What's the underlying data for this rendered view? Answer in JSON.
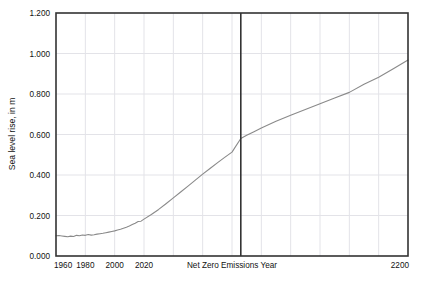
{
  "chart_data": {
    "type": "line",
    "title": "",
    "subtitle": "",
    "xlabel": "",
    "ylabel": "Sea level rise, in m",
    "xlim": [
      1960,
      2200
    ],
    "ylim": [
      0.0,
      1.2
    ],
    "grid": true,
    "legend": null,
    "x_tick_labels": [
      "1960",
      "1980",
      "2000",
      "2020",
      "2200"
    ],
    "x_tick_values": [
      1960,
      1980,
      2000,
      2020,
      2200
    ],
    "x_gridline_values": [
      1960,
      1980,
      2000,
      2020,
      2040,
      2060,
      2080,
      2100,
      2120,
      2140,
      2160,
      2180,
      2200
    ],
    "y_tick_labels": [
      "0.000",
      "0.200",
      "0.400",
      "0.600",
      "0.800",
      "1.000",
      "1.200"
    ],
    "y_tick_values": [
      0.0,
      0.2,
      0.4,
      0.6,
      0.8,
      1.0,
      1.2
    ],
    "annotations": [
      {
        "name": "net-zero-emissions-year",
        "label": "Net Zero Emissions Year",
        "type": "vertical-line",
        "x": 2086,
        "value_at_line": 0.58,
        "color": "#333333"
      }
    ],
    "series": [
      {
        "name": "Sea level rise",
        "color": "#8a8a8a",
        "x": [
          1960,
          1962,
          1964,
          1966,
          1968,
          1970,
          1972,
          1974,
          1976,
          1978,
          1980,
          1982,
          1984,
          1986,
          1988,
          1990,
          1992,
          1994,
          1996,
          1998,
          2000,
          2002,
          2004,
          2006,
          2008,
          2010,
          2012,
          2014,
          2016,
          2018,
          2020,
          2025,
          2030,
          2035,
          2040,
          2045,
          2050,
          2055,
          2060,
          2065,
          2070,
          2075,
          2080,
          2086,
          2090,
          2095,
          2100,
          2110,
          2120,
          2130,
          2140,
          2150,
          2160,
          2170,
          2180,
          2190,
          2200
        ],
        "y": [
          0.1,
          0.101,
          0.099,
          0.097,
          0.095,
          0.098,
          0.096,
          0.102,
          0.1,
          0.104,
          0.102,
          0.106,
          0.103,
          0.105,
          0.108,
          0.11,
          0.112,
          0.115,
          0.118,
          0.121,
          0.124,
          0.128,
          0.132,
          0.137,
          0.142,
          0.148,
          0.155,
          0.162,
          0.17,
          0.172,
          0.182,
          0.205,
          0.23,
          0.258,
          0.287,
          0.316,
          0.345,
          0.375,
          0.404,
          0.432,
          0.46,
          0.487,
          0.513,
          0.58,
          0.596,
          0.614,
          0.632,
          0.665,
          0.695,
          0.723,
          0.752,
          0.78,
          0.808,
          0.848,
          0.883,
          0.925,
          0.968
        ]
      }
    ]
  },
  "axes": {
    "y_label_text": "Sea level rise, in m",
    "x_left_label": "1960",
    "x_right_label": "2200"
  },
  "colors": {
    "series_line": "#8a8a8a",
    "frame": "#333333",
    "grid": "#e3e3e8",
    "annotation_line": "#333333",
    "text": "#111111",
    "background": "#ffffff"
  }
}
